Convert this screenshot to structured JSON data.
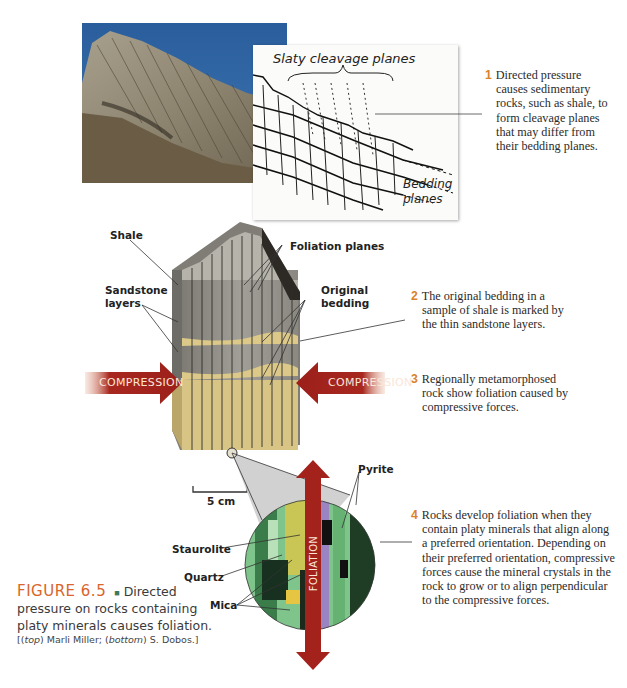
{
  "figure": {
    "number": "FIGURE 6.5",
    "separator": "■",
    "caption_line1": "Directed",
    "caption_line2": "pressure on rocks containing",
    "caption_line3": "platy minerals causes foliation.",
    "credit_open": "[(",
    "credit_top_label": "top",
    "credit_top_name": ") Marli Miller; (",
    "credit_bottom_label": "bottom",
    "credit_bottom_name": ") S. Dobos.]"
  },
  "sketch": {
    "title": "Slaty cleavage planes",
    "bedding_line1": "Bedding",
    "bedding_line2": "planes"
  },
  "steps": [
    {
      "num": "1",
      "lines": [
        "Directed pressure",
        "causes sedimentary",
        "rocks, such as shale, to",
        "form cleavage planes",
        "that may differ from",
        "their bedding planes."
      ]
    },
    {
      "num": "2",
      "lines": [
        "The original bedding in a",
        "sample of shale is marked by",
        "the thin sandstone layers."
      ]
    },
    {
      "num": "3",
      "lines": [
        "Regionally metamorphosed",
        "rock show foliation caused by",
        "compressive forces."
      ]
    },
    {
      "num": "4",
      "lines": [
        "Rocks develop foliation when they",
        "contain platy minerals that align along",
        "a preferred orientation. Depending on",
        "their preferred orientation, compressive",
        "forces cause the mineral crystals in the",
        "rock to grow or to align perpendicular",
        "to the compressive forces."
      ]
    }
  ],
  "block_labels": {
    "shale": "Shale",
    "foliation_planes": "Foliation planes",
    "sandstone_1": "Sandstone",
    "sandstone_2": "layers",
    "original_1": "Original",
    "original_2": "bedding",
    "compression_left": "COMPRESSION",
    "compression_right": "COMPRESSION",
    "scale": "5 cm"
  },
  "micro_labels": {
    "pyrite": "Pyrite",
    "staurolite": "Staurolite",
    "quartz": "Quartz",
    "mica": "Mica",
    "foliation": "FOLIATION"
  },
  "colors": {
    "accent_orange": "#d9822b",
    "caption_orange": "#d9652b",
    "arrow_red": "#9c1f1a",
    "sandstone": "#dcc98a",
    "shale_gray": "#8f8d86"
  }
}
